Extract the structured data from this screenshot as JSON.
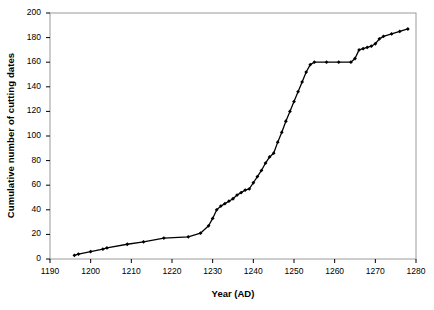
{
  "chart_data": {
    "type": "line",
    "title": "",
    "xlabel": "Year (AD)",
    "ylabel": "Cumulative number of cutting dates",
    "xlim": [
      1190,
      1280
    ],
    "ylim": [
      0,
      200
    ],
    "xticks": [
      1190,
      1200,
      1210,
      1220,
      1230,
      1240,
      1250,
      1260,
      1270,
      1280
    ],
    "yticks": [
      0,
      20,
      40,
      60,
      80,
      100,
      120,
      140,
      160,
      180,
      200
    ],
    "grid": false,
    "legend": null,
    "marker": "diamond",
    "line_color": "#000000",
    "series": [
      {
        "name": "Cumulative cutting dates",
        "x": [
          1196,
          1197,
          1200,
          1203,
          1204,
          1209,
          1213,
          1218,
          1224,
          1227,
          1229,
          1230,
          1231,
          1232,
          1233,
          1234,
          1235,
          1236,
          1237,
          1238,
          1239,
          1240,
          1241,
          1242,
          1243,
          1244,
          1245,
          1246,
          1247,
          1248,
          1249,
          1250,
          1251,
          1252,
          1253,
          1254,
          1255,
          1258,
          1261,
          1264,
          1265,
          1266,
          1267,
          1268,
          1269,
          1270,
          1271,
          1272,
          1274,
          1276,
          1278
        ],
        "y": [
          3,
          4,
          6,
          8,
          9,
          12,
          14,
          17,
          18,
          21,
          27,
          33,
          40,
          43,
          45,
          47,
          49,
          52,
          54,
          56,
          57,
          62,
          67,
          72,
          78,
          83,
          86,
          95,
          103,
          112,
          120,
          128,
          136,
          144,
          152,
          158,
          160,
          160,
          160,
          160,
          163,
          170,
          171,
          172,
          173,
          175,
          179,
          181,
          183,
          185,
          187
        ]
      }
    ]
  },
  "axes": {
    "frame_color": "#9a9a9a",
    "tick_color": "#000000"
  }
}
